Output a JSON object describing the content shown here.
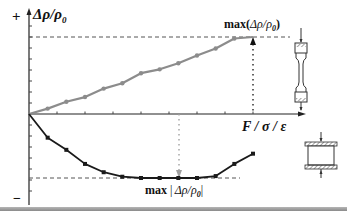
{
  "chart_data": {
    "type": "line",
    "title": "",
    "xlabel": "F / σ / ε",
    "ylabel": "Δρ/ρ0",
    "y_positive_sign": "+",
    "y_negative_sign": "−",
    "grid": false,
    "legend": "none (specimen icons on right: tension dogbone for upper curve, compression cylinder for lower curve)",
    "x": [
      0,
      1,
      2,
      3,
      4,
      5,
      6,
      7,
      8,
      9,
      10,
      11,
      12
    ],
    "series": [
      {
        "name": "tension (dogbone specimen)",
        "color": "#8c8c8c",
        "marker": "circle",
        "values": [
          0,
          0.07,
          0.16,
          0.22,
          0.33,
          0.4,
          0.53,
          0.58,
          0.66,
          0.76,
          0.85,
          0.98,
          1.0
        ]
      },
      {
        "name": "compression (cylinder specimen)",
        "color": "#1a1a1a",
        "marker": "square",
        "values": [
          0,
          -0.37,
          -0.56,
          -0.78,
          -0.91,
          -0.98,
          -1.0,
          -1.0,
          -1.0,
          -1.0,
          -0.97,
          -0.78,
          -0.62
        ]
      }
    ],
    "annotations": [
      {
        "text": "max(Δρ/ρ0)",
        "target": "upper curve maximum (end point)",
        "style": "dotted vertical arrow to x-axis"
      },
      {
        "text": "max|Δρ/ρ0|",
        "target": "lower curve minimum",
        "style": "gray dotted vertical arrow"
      }
    ],
    "reference_lines": [
      {
        "type": "horizontal-dashed",
        "at": "max(Δρ/ρ0)"
      },
      {
        "type": "horizontal-dashed",
        "at": "-max|Δρ/ρ0|"
      }
    ]
  },
  "labels": {
    "plus": "+",
    "minus": "−",
    "y_axis_delta": "Δρ/ρ",
    "y_axis_sub": "0",
    "x_axis": "F / σ / ε",
    "max_top_prefix": "max(",
    "max_top_body": "Δρ/ρ",
    "max_top_sub": "0",
    "max_top_suffix": ")",
    "max_bottom_prefix": "max",
    "max_bottom_body": "Δρ/ρ",
    "max_bottom_sub": "0",
    "specimen_force": "F"
  },
  "colors": {
    "upper_curve": "#8c8c8c",
    "lower_curve": "#1a1a1a",
    "axis": "#222222",
    "dashed": "#555555"
  }
}
